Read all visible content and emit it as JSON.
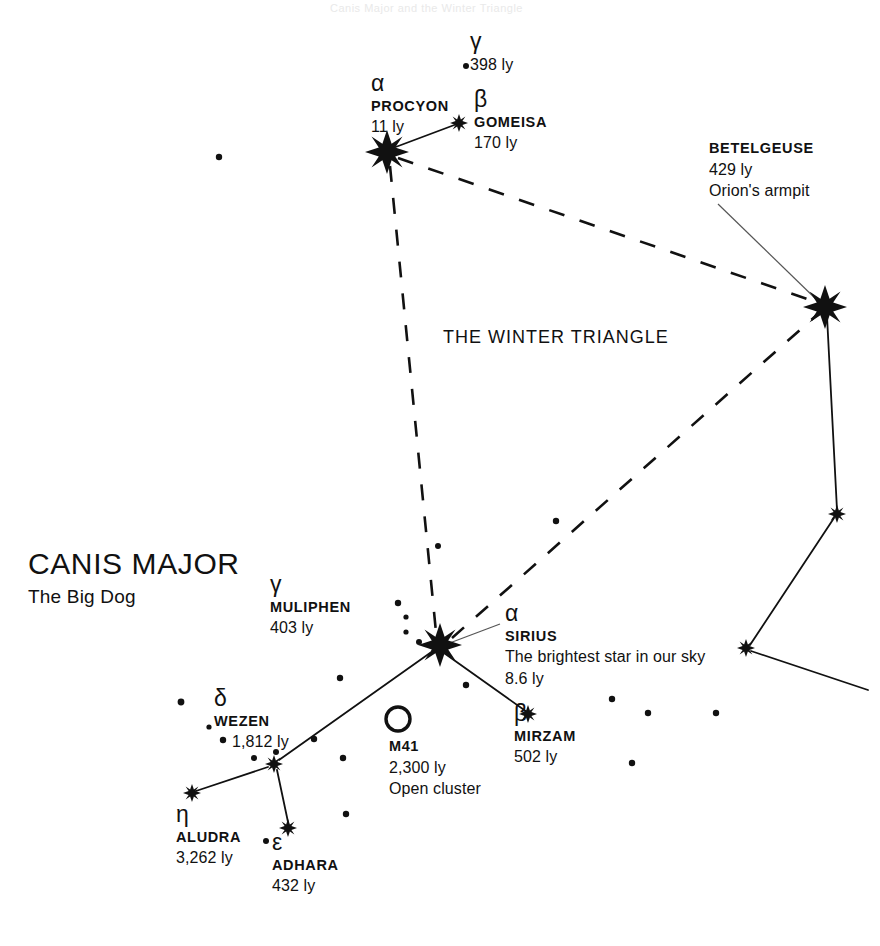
{
  "chart": {
    "constellation_name": "CANIS MAJOR",
    "constellation_subtitle": "The Big Dog",
    "asterism_label": "THE WINTER TRIANGLE",
    "background_color": "#ffffff",
    "ink_color": "#111111",
    "top_trim_text": "Canis Major and the Winter Triangle"
  },
  "stars": [
    {
      "id": "procyon",
      "greek": "α",
      "name": "PROCYON",
      "distance": "11 ly",
      "note": "",
      "x": 387,
      "y": 152,
      "magnitude_class": "bright"
    },
    {
      "id": "gomeisa",
      "greek": "β",
      "name": "GOMEISA",
      "distance": "170 ly",
      "note": "",
      "x": 459,
      "y": 123,
      "magnitude_class": "medium"
    },
    {
      "id": "gamma-cmi",
      "greek": "γ",
      "name": "",
      "distance": "398 ly",
      "note": "",
      "x": 466,
      "y": 66,
      "magnitude_class": "faint"
    },
    {
      "id": "betelgeuse",
      "greek": "",
      "name": "BETELGEUSE",
      "distance": "429 ly",
      "note": "Orion's armpit",
      "x": 825,
      "y": 307,
      "magnitude_class": "bright"
    },
    {
      "id": "sirius",
      "greek": "α",
      "name": "SIRIUS",
      "distance": "8.6 ly",
      "note": "The brightest star in our sky",
      "x": 440,
      "y": 645,
      "magnitude_class": "bright"
    },
    {
      "id": "mirzam",
      "greek": "β",
      "name": "MIRZAM",
      "distance": "502 ly",
      "note": "",
      "x": 528,
      "y": 714,
      "magnitude_class": "medium"
    },
    {
      "id": "muliphen",
      "greek": "γ",
      "name": "MULIPHEN",
      "distance": "403 ly",
      "note": "",
      "x": 376,
      "y": 604,
      "magnitude_class": "faint"
    },
    {
      "id": "wezen",
      "greek": "δ",
      "name": "WEZEN",
      "distance": "1,812 ly",
      "note": "",
      "x": 274,
      "y": 764,
      "magnitude_class": "medium"
    },
    {
      "id": "aludra",
      "greek": "η",
      "name": "ALUDRA",
      "distance": "3,262 ly",
      "note": "",
      "x": 192,
      "y": 793,
      "magnitude_class": "medium"
    },
    {
      "id": "adhara",
      "greek": "ε",
      "name": "ADHARA",
      "distance": "432 ly",
      "note": "",
      "x": 288,
      "y": 828,
      "magnitude_class": "medium"
    }
  ],
  "deep_sky": [
    {
      "id": "m41",
      "name": "M41",
      "distance": "2,300 ly",
      "note": "Open cluster",
      "x": 398,
      "y": 719
    }
  ],
  "orion_stars": [
    {
      "id": "orion-belt-upper",
      "x": 837,
      "y": 514
    },
    {
      "id": "orion-knee",
      "x": 746,
      "y": 648
    }
  ],
  "field_stars": [
    {
      "x": 219,
      "y": 157,
      "r": 3.2
    },
    {
      "x": 466,
      "y": 66,
      "r": 3.0
    },
    {
      "x": 556,
      "y": 521,
      "r": 3.2
    },
    {
      "x": 438,
      "y": 546,
      "r": 3.0
    },
    {
      "x": 398,
      "y": 603,
      "r": 3.2
    },
    {
      "x": 406,
      "y": 617,
      "r": 2.6
    },
    {
      "x": 406,
      "y": 632,
      "r": 2.6
    },
    {
      "x": 419,
      "y": 642,
      "r": 3.0
    },
    {
      "x": 466,
      "y": 685,
      "r": 3.2
    },
    {
      "x": 340,
      "y": 678,
      "r": 3.2
    },
    {
      "x": 181,
      "y": 702,
      "r": 3.4
    },
    {
      "x": 223,
      "y": 740,
      "r": 3.2
    },
    {
      "x": 254,
      "y": 758,
      "r": 3.0
    },
    {
      "x": 276,
      "y": 752,
      "r": 3.0
    },
    {
      "x": 314,
      "y": 739,
      "r": 3.2
    },
    {
      "x": 343,
      "y": 758,
      "r": 3.2
    },
    {
      "x": 346,
      "y": 814,
      "r": 3.2
    },
    {
      "x": 266,
      "y": 841,
      "r": 3.0
    },
    {
      "x": 612,
      "y": 699,
      "r": 3.2
    },
    {
      "x": 648,
      "y": 713,
      "r": 3.2
    },
    {
      "x": 716,
      "y": 713,
      "r": 3.2
    },
    {
      "x": 632,
      "y": 763,
      "r": 3.2
    },
    {
      "x": 209,
      "y": 727,
      "r": 2.6
    }
  ],
  "solid_lines": [
    {
      "from": "procyon",
      "to": "gomeisa",
      "x1": 393,
      "y1": 148,
      "x2": 457,
      "y2": 124
    },
    {
      "from": "sirius",
      "to": "mirzam",
      "x1": 444,
      "y1": 653,
      "x2": 527,
      "y2": 712
    },
    {
      "from": "sirius",
      "to": "wezen",
      "x1": 430,
      "y1": 653,
      "x2": 279,
      "y2": 760
    },
    {
      "from": "wezen",
      "to": "aludra",
      "x1": 268,
      "y1": 767,
      "x2": 196,
      "y2": 791
    },
    {
      "from": "wezen",
      "to": "adhara",
      "x1": 277,
      "y1": 770,
      "x2": 288,
      "y2": 822
    },
    {
      "from": "betelgeuse",
      "to": "orion-belt-upper",
      "x1": 827,
      "y1": 316,
      "x2": 837,
      "y2": 510
    },
    {
      "from": "orion-belt-upper",
      "to": "orion-knee",
      "x1": 834,
      "y1": 518,
      "x2": 750,
      "y2": 645
    },
    {
      "from": "orion-knee",
      "to": "orion-edge",
      "x1": 751,
      "y1": 651,
      "x2": 868,
      "y2": 690
    }
  ],
  "dashed_lines": [
    {
      "from": "procyon",
      "to": "sirius",
      "x1": 390,
      "y1": 166,
      "x2": 436,
      "y2": 632
    },
    {
      "from": "procyon",
      "to": "betelgeuse",
      "x1": 398,
      "y1": 158,
      "x2": 816,
      "y2": 302
    },
    {
      "from": "sirius",
      "to": "betelgeuse",
      "x1": 452,
      "y1": 638,
      "x2": 818,
      "y2": 314
    }
  ],
  "leader_lines": [
    {
      "label": "betelgeuse",
      "x1": 718,
      "y1": 204,
      "x2": 820,
      "y2": 303
    },
    {
      "label": "sirius",
      "x1": 500,
      "y1": 624,
      "x2": 447,
      "y2": 644
    }
  ],
  "labels": {
    "constellation": {
      "x": 28,
      "y": 546
    },
    "constellation_sub": {
      "x": 28,
      "y": 586
    },
    "asterism": {
      "x": 443,
      "y": 327
    },
    "procyon": {
      "x": 371,
      "y": 76
    },
    "gomeisa": {
      "x": 474,
      "y": 92
    },
    "gamma_cmi": {
      "x": 474,
      "y": 32
    },
    "betelgeuse": {
      "x": 709,
      "y": 139
    },
    "sirius": {
      "x": 505,
      "y": 605
    },
    "mirzam": {
      "x": 514,
      "y": 705
    },
    "muliphen": {
      "x": 270,
      "y": 576
    },
    "wezen": {
      "x": 214,
      "y": 690
    },
    "aludra": {
      "x": 176,
      "y": 806
    },
    "adhara": {
      "x": 272,
      "y": 834
    },
    "m41": {
      "x": 389,
      "y": 737
    }
  }
}
